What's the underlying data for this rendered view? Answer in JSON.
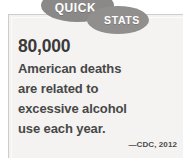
{
  "card": {
    "badge": {
      "primary_label": "QUICK",
      "secondary_label": "STATS",
      "badge_color": "#8a8987",
      "badge_text_color": "#ffffff"
    },
    "headline_number": "80,000",
    "body_lines": [
      "American deaths",
      "are related to",
      "excessive alcohol",
      "use each year."
    ],
    "source": "—CDC, 2012",
    "background_color": "#f3f2f0",
    "number_color": "#3a3a3a",
    "body_text_color": "#474747"
  }
}
